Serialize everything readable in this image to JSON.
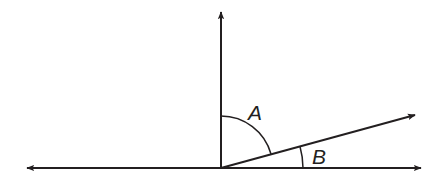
{
  "diagram": {
    "type": "angle-diagram",
    "labels": {
      "angle_a": "A",
      "angle_b": "B"
    },
    "colors": {
      "stroke": "#231f20",
      "background": "#ffffff"
    }
  }
}
